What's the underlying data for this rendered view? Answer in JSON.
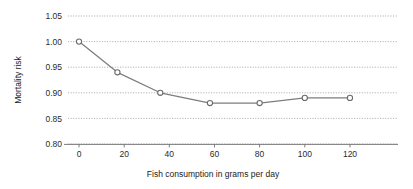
{
  "chart_data": {
    "type": "line",
    "title": "",
    "subtitle": "",
    "xlabel": "Fish consumption in grams per day",
    "ylabel": "Mortality risk",
    "x": [
      0,
      17,
      36,
      58,
      80,
      100,
      120
    ],
    "values": [
      1.0,
      0.94,
      0.9,
      0.88,
      0.88,
      0.89,
      0.89
    ],
    "series": [
      {
        "name": "Mortality risk",
        "x": [
          0,
          17,
          36,
          58,
          80,
          100,
          120
        ],
        "values": [
          1.0,
          0.94,
          0.9,
          0.88,
          0.88,
          0.89,
          0.89
        ]
      }
    ],
    "xlim": [
      -7,
      134
    ],
    "ylim": [
      0.8,
      1.05
    ],
    "xticks": [
      0,
      20,
      40,
      60,
      80,
      100,
      120
    ],
    "xtick_labels": [
      "0",
      "20",
      "40",
      "60",
      "80",
      "100",
      "120"
    ],
    "yticks": [
      0.8,
      0.85,
      0.9,
      0.95,
      1.0,
      1.05
    ],
    "ytick_labels": [
      "0.80",
      "0.85",
      "0.90",
      "0.95",
      "1.00",
      "1.05"
    ],
    "grid": "horizontal-dotted",
    "legend": "none",
    "marker": "open-circle",
    "line_color": "#7d7d7d",
    "marker_fill": "#ffffff",
    "marker_stroke": "#6b6b6b",
    "grid_color": "#9a9a9a",
    "axis_color": "#6f6f6f",
    "text_color": "#2b2b2b",
    "background": "#ffffff"
  },
  "layout": {
    "plot_left_px": 79,
    "plot_right_px": 398,
    "plot_top_px": 16,
    "plot_bottom_px": 144,
    "px_per_x_unit": 2.258,
    "px_per_y_005": 25.6
  }
}
